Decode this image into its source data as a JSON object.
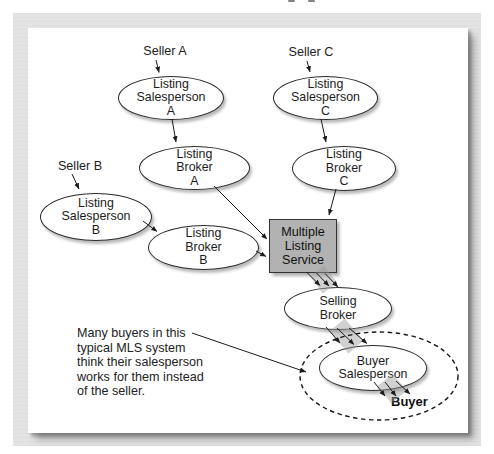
{
  "figure": {
    "sellers": {
      "a": "Seller A",
      "b": "Seller B",
      "c": "Seller C"
    },
    "nodes": {
      "listing_salesperson_a": "Listing\nSalesperson\nA",
      "listing_broker_a": "Listing\nBroker\nA",
      "listing_salesperson_b": "Listing\nSalesperson\nB",
      "listing_broker_b": "Listing\nBroker\nB",
      "listing_salesperson_c": "Listing\nSalesperson\nC",
      "listing_broker_c": "Listing\nBroker\nC",
      "mls": "Multiple\nListing\nService",
      "selling_broker": "Selling\nBroker",
      "buyer_salesperson": "Buyer\nSalesperson"
    },
    "buyer_label": "Buyer",
    "annotation": "Many buyers in this\ntypical MLS system\nthink their salesperson\nworks for them instead\nof the seller.",
    "colors": {
      "mls_box_fill": "#b2b2b2",
      "node_fill": "#ffffff",
      "outline_color": "#2b2b2b",
      "line_color": "#1b1b1b",
      "frame_gray": "#e3e3e3"
    }
  }
}
